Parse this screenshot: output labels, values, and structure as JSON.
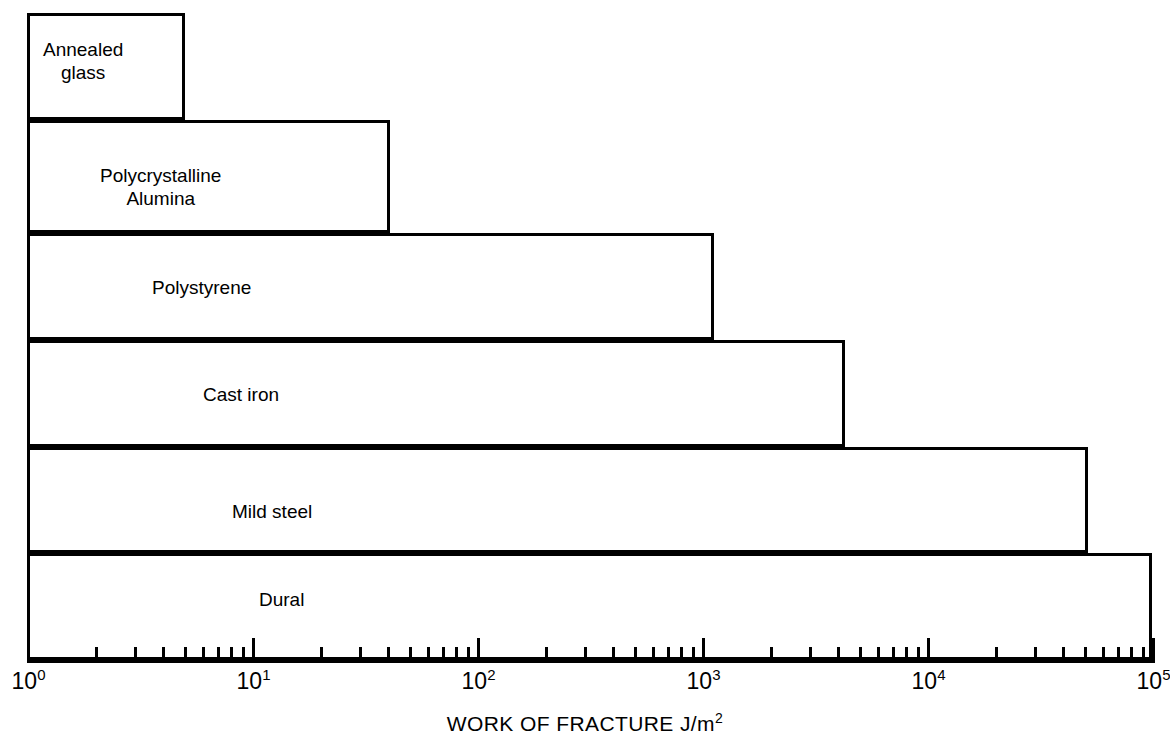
{
  "chart_data": {
    "type": "bar",
    "orientation": "horizontal",
    "title": "",
    "xlabel": "WORK OF FRACTURE J/m2",
    "xlabel_base": "WORK OF FRACTURE J/m",
    "xlabel_sup": "2",
    "ylabel": "",
    "xscale": "log",
    "xlim": [
      1,
      100000
    ],
    "grid": false,
    "legend": null,
    "categories": [
      "Annealed glass",
      "Polycrystalline Alumina",
      "Polystyrene",
      "Cast iron",
      "Mild steel",
      "Dural"
    ],
    "values": [
      5,
      42,
      1200,
      4500,
      55000,
      100000
    ],
    "bars": [
      {
        "label_lines": [
          "Annealed",
          "glass"
        ],
        "value": 5,
        "left_value": 1,
        "label_align": "left",
        "label_x": 43,
        "label_y": 38,
        "top": 13,
        "bottom": 120,
        "right_px": 185
      },
      {
        "label_lines": [
          "Polycrystalline",
          "Alumina"
        ],
        "value": 42,
        "left_value": 1,
        "label_align": "center",
        "label_x": 100,
        "label_y": 164,
        "top": 120,
        "bottom": 233,
        "right_px": 390
      },
      {
        "label_lines": [
          "Polystyrene"
        ],
        "value": 1200,
        "left_value": 1,
        "label_align": "left",
        "label_x": 152,
        "label_y": 276,
        "top": 233,
        "bottom": 340,
        "right_px": 714
      },
      {
        "label_lines": [
          "Cast iron"
        ],
        "value": 4500,
        "left_value": 1,
        "label_align": "left",
        "label_x": 203,
        "label_y": 383,
        "top": 340,
        "bottom": 447,
        "right_px": 845
      },
      {
        "label_lines": [
          "Mild steel"
        ],
        "value": 55000,
        "left_value": 1,
        "label_align": "left",
        "label_x": 232,
        "label_y": 500,
        "top": 447,
        "bottom": 553,
        "right_px": 1088
      },
      {
        "label_lines": [
          "Dural"
        ],
        "value": 100000,
        "left_value": 1,
        "label_align": "left",
        "label_x": 259,
        "label_y": 588,
        "top": 553,
        "bottom": 660,
        "right_px": 1152
      }
    ],
    "decade_ticks": [
      {
        "exponent": "0",
        "base": "10",
        "value": 1
      },
      {
        "exponent": "1",
        "base": "10",
        "value": 10
      },
      {
        "exponent": "2",
        "base": "10",
        "value": 100
      },
      {
        "exponent": "3",
        "base": "10",
        "value": 1000
      },
      {
        "exponent": "4",
        "base": "10",
        "value": 10000
      },
      {
        "exponent": "5",
        "base": "10",
        "value": 100000
      }
    ],
    "minor_tick_multipliers": [
      2,
      3,
      4,
      5,
      6,
      7,
      8,
      9
    ],
    "axis_color": "#000000",
    "bar_fill": "#ffffff",
    "bar_stroke": "#000000"
  },
  "geometry": {
    "axis_x0": 27,
    "axis_x1": 1152,
    "axis_y": 660,
    "decade_px": 225,
    "major_tick_h": 22,
    "minor_tick_h": 13,
    "axis_title_y": 712
  }
}
